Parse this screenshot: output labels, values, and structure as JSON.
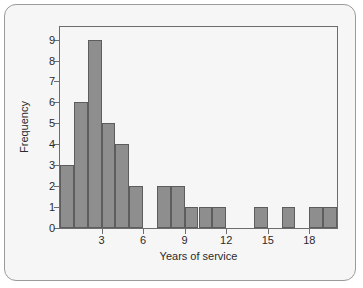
{
  "chart_data": {
    "type": "bar",
    "title": "",
    "subtitle": "",
    "xlabel": "Years of service",
    "ylabel": "Frequency",
    "bin_width": 1,
    "bin_starts": [
      0,
      1,
      2,
      3,
      4,
      5,
      6,
      7,
      8,
      9,
      10,
      11,
      12,
      13,
      14,
      15,
      16,
      17,
      18,
      19
    ],
    "categories": [
      "0-1",
      "1-2",
      "2-3",
      "3-4",
      "4-5",
      "5-6",
      "6-7",
      "7-8",
      "8-9",
      "9-10",
      "10-11",
      "11-12",
      "12-13",
      "13-14",
      "14-15",
      "15-16",
      "16-17",
      "17-18",
      "18-19",
      "19-20"
    ],
    "values": [
      3,
      6,
      9,
      5,
      4,
      2,
      0,
      2,
      2,
      1,
      1,
      1,
      0,
      0,
      1,
      0,
      1,
      0,
      1,
      1
    ],
    "xlim": [
      0,
      20
    ],
    "ylim": [
      0,
      9.6
    ],
    "xticks": [
      3,
      6,
      9,
      12,
      15,
      18
    ],
    "xtick_labels": [
      "3",
      "6",
      "9",
      "12",
      "15",
      "18"
    ],
    "yticks": [
      0,
      1,
      2,
      3,
      4,
      5,
      6,
      7,
      8,
      9
    ],
    "ytick_labels": [
      "0",
      "1",
      "2",
      "3",
      "4",
      "5",
      "6",
      "7",
      "8",
      "9"
    ],
    "grid": false,
    "legend": false,
    "legend_position": "none",
    "bar_color": "#8e8e8e",
    "bar_edge_color": "#5d5d5d",
    "background_color": "#f6f6f6",
    "axis_color": "#6d6d6d",
    "text_color": "#2b2b2b"
  },
  "card": {
    "border_color": "#9a9a9a",
    "background_color": "#f6f6f6"
  }
}
